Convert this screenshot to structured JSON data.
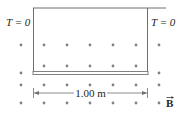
{
  "diagram": {
    "left_tension_label": "T = 0",
    "right_tension_label": "T = 0",
    "length_label": "1.00 m",
    "field_label": "B",
    "field_direction": "out-of-page",
    "colors": {
      "wire": "#6d6e71",
      "rod": "#808285",
      "dots": "#808285",
      "text": "#231f20"
    },
    "dot_rows_y": [
      45,
      73,
      103
    ],
    "dot_columns_x": [
      21,
      44,
      67,
      90,
      113,
      136,
      159
    ]
  }
}
